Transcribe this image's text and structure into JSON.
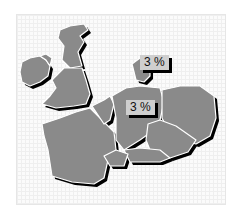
{
  "map": {
    "colors": {
      "country_fill": "#8a8a8a",
      "border": "#ffffff",
      "shadow": "#000000",
      "label_bg": "#cfcfcf",
      "background": "#fbfbfb"
    },
    "labels": [
      {
        "text": "3 %",
        "region": "denmark"
      },
      {
        "text": "3 %",
        "region": "germany"
      }
    ],
    "regions": [
      "ireland",
      "northern-ireland",
      "scotland",
      "england-wales",
      "france",
      "belgium-netherlands",
      "denmark",
      "germany",
      "poland",
      "czechia",
      "austria",
      "switzerland"
    ]
  }
}
